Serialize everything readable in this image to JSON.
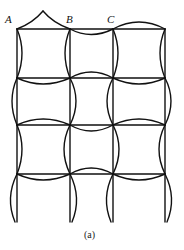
{
  "labels": {
    "A": "A",
    "B": "B",
    "C": "C"
  },
  "caption": "(a)",
  "grid": {
    "columns_x": [
      17,
      70,
      113,
      165
    ],
    "rows_y": [
      29,
      78,
      125,
      174
    ],
    "bottom_y": 222
  },
  "colors": {
    "stroke": "#111111",
    "background": "#ffffff"
  }
}
